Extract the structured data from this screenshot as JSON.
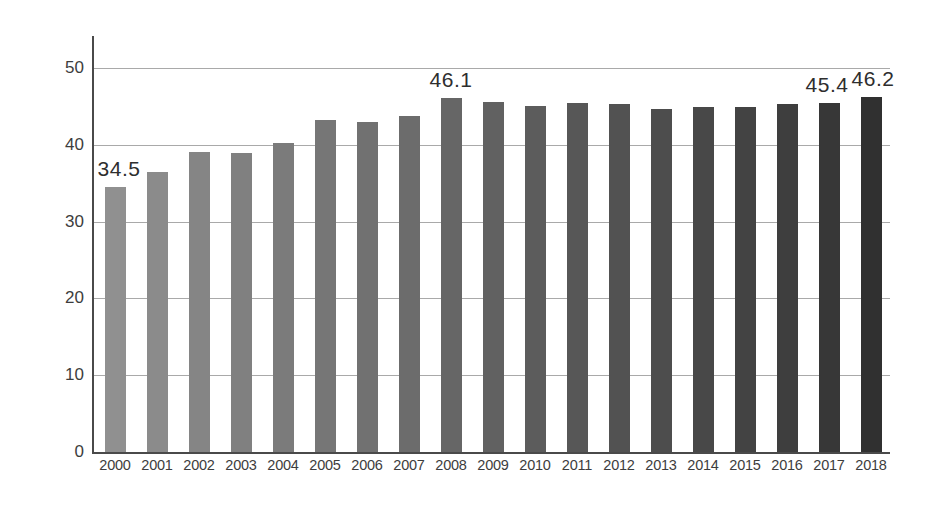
{
  "chart_data": {
    "type": "bar",
    "title": "",
    "subtitle": "",
    "xlabel": "",
    "ylabel": "",
    "ylim": [
      0,
      52
    ],
    "yticks": [
      0,
      10,
      20,
      30,
      40,
      50
    ],
    "grid": true,
    "legend": "none",
    "categories": [
      "2000",
      "2001",
      "2002",
      "2003",
      "2004",
      "2005",
      "2006",
      "2007",
      "2008",
      "2009",
      "2010",
      "2011",
      "2012",
      "2013",
      "2014",
      "2015",
      "2016",
      "2017",
      "2018"
    ],
    "values": [
      34.5,
      36.4,
      39.0,
      38.9,
      40.3,
      43.2,
      43.0,
      43.7,
      46.1,
      45.6,
      45.1,
      45.5,
      45.3,
      44.7,
      44.9,
      44.9,
      45.3,
      45.4,
      46.2
    ],
    "bar_colors": [
      "#909090",
      "#8b8b8b",
      "#858585",
      "#808080",
      "#7b7b7b",
      "#767676",
      "#717171",
      "#6c6c6c",
      "#666666",
      "#616161",
      "#5c5c5c",
      "#575757",
      "#525252",
      "#4d4d4d",
      "#484848",
      "#434343",
      "#3e3e3e",
      "#373737",
      "#303030"
    ],
    "point_labels": [
      {
        "category": "2000",
        "value": 34.5,
        "text": "34.5"
      },
      {
        "category": "2008",
        "value": 46.1,
        "text": "46.1"
      },
      {
        "category": "2017",
        "value": 45.4,
        "text": "45.4"
      },
      {
        "category": "2018",
        "value": 46.2,
        "text": "46.2"
      }
    ],
    "axis_color": "#4a4a4a",
    "grid_color": "#a9a9a9",
    "background": "#ffffff"
  }
}
